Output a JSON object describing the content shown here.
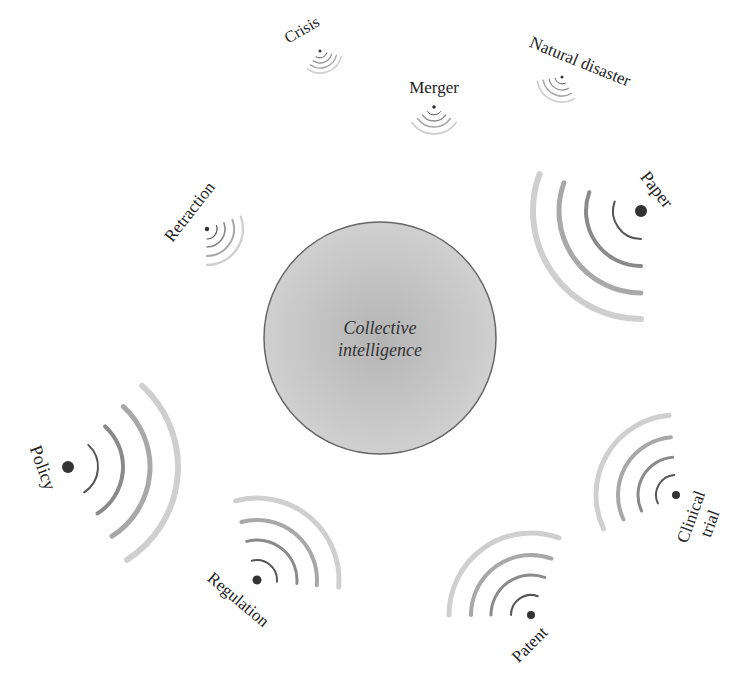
{
  "center": {
    "label_line1": "Collective",
    "label_line2": "intelligence",
    "cx": 380,
    "cy": 338,
    "r": 116,
    "fill_center": "#b4b4b4",
    "fill_edge": "#d0d0d0",
    "stroke": "#666666"
  },
  "signals": [
    {
      "id": "crisis",
      "label": "Crisis",
      "x": 320,
      "y": 51,
      "dot_r": 1.5,
      "dir": 70,
      "span": 110,
      "radii": [
        7,
        12,
        17,
        22
      ],
      "widths": [
        1,
        1.2,
        1.4,
        1.6
      ],
      "label_x": 302,
      "label_y": 30,
      "label_rot": -30,
      "label_size": 16
    },
    {
      "id": "merger",
      "label": "Merger",
      "x": 434,
      "y": 107,
      "dot_r": 1.8,
      "dir": 90,
      "span": 110,
      "radii": [
        8,
        14,
        20,
        27
      ],
      "widths": [
        1,
        1.3,
        1.6,
        1.8
      ],
      "label_x": 434,
      "label_y": 88,
      "label_rot": 0,
      "label_size": 17
    },
    {
      "id": "natural-disaster",
      "label": "Natural disaster",
      "x": 562,
      "y": 77,
      "dot_r": 1.5,
      "dir": 115,
      "span": 110,
      "radii": [
        7,
        13,
        19,
        25
      ],
      "widths": [
        1,
        1.3,
        1.5,
        1.7
      ],
      "label_x": 580,
      "label_y": 62,
      "label_rot": 22,
      "label_size": 17
    },
    {
      "id": "retraction",
      "label": "Retraction",
      "x": 207,
      "y": 229,
      "dot_r": 2.2,
      "dir": 35,
      "span": 110,
      "radii": [
        10,
        18,
        27,
        36
      ],
      "widths": [
        1.2,
        1.6,
        2,
        2.3
      ],
      "label_x": 190,
      "label_y": 212,
      "label_rot": -52,
      "label_size": 17
    },
    {
      "id": "paper",
      "label": "Paper",
      "x": 641,
      "y": 211,
      "dot_r": 6,
      "dir": 145,
      "span": 110,
      "radii": [
        28,
        55,
        82,
        108
      ],
      "widths": [
        2,
        4,
        5,
        6
      ],
      "label_x": 656,
      "label_y": 190,
      "label_rot": 52,
      "label_size": 18
    },
    {
      "id": "policy",
      "label": "Policy",
      "x": 68,
      "y": 467,
      "dot_r": 6,
      "dir": 5,
      "span": 105,
      "radii": [
        30,
        55,
        82,
        110
      ],
      "widths": [
        2,
        4,
        5,
        6
      ],
      "label_x": 42,
      "label_y": 468,
      "label_rot": 70,
      "label_size": 18
    },
    {
      "id": "regulation",
      "label": "Regulation",
      "x": 257,
      "y": 580,
      "dot_r": 4.5,
      "dir": -50,
      "span": 110,
      "radii": [
        20,
        40,
        60,
        82
      ],
      "widths": [
        2,
        3,
        4,
        5
      ],
      "label_x": 238,
      "label_y": 600,
      "label_rot": 40,
      "label_size": 17
    },
    {
      "id": "patent",
      "label": "Patent",
      "x": 531,
      "y": 615,
      "dot_r": 4,
      "dir": -125,
      "span": 110,
      "radii": [
        20,
        40,
        60,
        82
      ],
      "widths": [
        2,
        3,
        4,
        5
      ],
      "label_x": 530,
      "label_y": 645,
      "label_rot": -45,
      "label_size": 17
    },
    {
      "id": "clinical-trial",
      "label": "Clinical",
      "label2": "trial",
      "x": 676,
      "y": 495,
      "dot_r": 4,
      "dir": -150,
      "span": 110,
      "radii": [
        20,
        38,
        58,
        80
      ],
      "widths": [
        2,
        3,
        4,
        5
      ],
      "label_x": 700,
      "label_y": 520,
      "label_rot": -70,
      "label_size": 17
    }
  ],
  "colors": {
    "dot": "#333333",
    "arc_levels": [
      "#555555",
      "#8a8a8a",
      "#a8a8a8",
      "#cfcfcf"
    ]
  }
}
